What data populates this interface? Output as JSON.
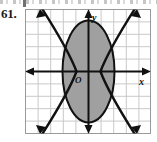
{
  "exercise": {
    "number_label": "61."
  },
  "figure": {
    "name": "system-of-inequalities-graph",
    "axis_labels": {
      "x": "x",
      "y": "y",
      "origin": "O"
    },
    "colors": {
      "grid_line": "#c9c9c9",
      "grid_border": "#9a9a9a",
      "axis": "#111111",
      "curve": "#111111",
      "shade_fill": "#a0a0a0",
      "background": "#ffffff",
      "number_text": "#1a1a1a"
    },
    "grid": {
      "columns": 10,
      "rows": 10,
      "cell_size_px": 12.6,
      "show_grid": true
    },
    "axes": {
      "x_axis_row": 5,
      "y_axis_column": 5,
      "x_arrow_both_ends": true,
      "y_arrow_both_ends": true
    },
    "curves": [
      {
        "name": "ellipse",
        "type": "ellipse",
        "center": [
          0,
          0
        ],
        "semi_axis_x": 2.05,
        "semi_axis_y": 4.05,
        "style": "solid",
        "stroke_width": 2.0
      },
      {
        "name": "hyperbola-branch-left",
        "type": "v-curve",
        "vertex": [
          -1.05,
          0
        ],
        "opens": "both-up-and-down",
        "style": "solid",
        "stroke_width": 2.0
      },
      {
        "name": "hyperbola-branch-right",
        "type": "v-curve",
        "vertex": [
          1.05,
          0
        ],
        "opens": "both-up-and-down",
        "style": "solid",
        "stroke_width": 2.0
      }
    ],
    "shaded_region": {
      "name": "solution-region",
      "description": "interior of ellipse",
      "fill": "#a0a0a0",
      "opacity": 1
    },
    "arrow_tips": {
      "count": 8,
      "description": "four curve arrowheads top, four bottom"
    }
  }
}
